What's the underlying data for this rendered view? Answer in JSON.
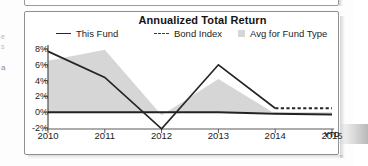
{
  "chart_data": {
    "type": "line",
    "title": "Annualized Total Return",
    "xlabel": "",
    "ylabel": "",
    "grid": false,
    "legend_position": "top",
    "categories": [
      "2010",
      "2011",
      "2012",
      "2013",
      "2014",
      "2015"
    ],
    "x_axis": {
      "tick_labels": [
        "2010",
        "2011",
        "2012",
        "2013",
        "2014",
        "2015"
      ],
      "suffix_label": "YTD"
    },
    "y_axis": {
      "tick_labels": [
        "8%",
        "6%",
        "4%",
        "2%",
        "0%",
        "-2%"
      ],
      "tick_values": [
        8,
        6,
        4,
        2,
        0,
        -2
      ],
      "ylim": [
        -2,
        8
      ],
      "unit": "%"
    },
    "series": [
      {
        "name": "This Fund",
        "style": "solid-then-dashed",
        "color": "#252525",
        "values": [
          7.7,
          4.4,
          -2.1,
          6.0,
          0.5,
          0.5
        ]
      },
      {
        "name": "Bond Index",
        "style": "solid",
        "color": "#222222",
        "values": [
          0.0,
          0.0,
          0.0,
          0.0,
          -0.2,
          -0.3
        ]
      },
      {
        "name": "Avg for Fund Type",
        "style": "area",
        "color": "#d6d6d6",
        "values": [
          6.5,
          7.9,
          -0.4,
          4.2,
          -0.2,
          -0.2
        ]
      }
    ]
  },
  "legend": {
    "items": [
      {
        "label": "This Fund",
        "marker": "line-solid-icon"
      },
      {
        "label": "Bond Index",
        "marker": "line-dashed-icon"
      },
      {
        "label": "Avg for Fund Type",
        "marker": "area-swatch-icon"
      }
    ]
  },
  "gutter_fragments": {
    "frag_1": "e",
    "frag_2": "s",
    "frag_3": "a"
  },
  "colors": {
    "area_fill": "#d6d6d6",
    "line": "#252525",
    "axis": "#5a5a5a",
    "panel_border": "#8f8f8f",
    "text": "#1b1b1b"
  }
}
